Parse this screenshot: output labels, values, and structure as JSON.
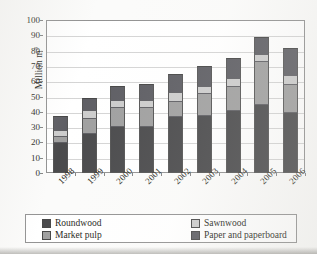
{
  "chart_data": {
    "type": "bar",
    "subtype": "stacked-bar",
    "title": "",
    "xlabel": "",
    "ylabel": "Million m",
    "ylabel_superscript": "3",
    "ylim": [
      0,
      100
    ],
    "ytick_step": 10,
    "yticks": [
      "100",
      "90",
      "80",
      "70",
      "60",
      "50",
      "40",
      "30",
      "20",
      "10",
      "0"
    ],
    "grid": true,
    "legend_position": "bottom",
    "categories": [
      "1998",
      "1999",
      "2000",
      "2001",
      "2002",
      "2003",
      "2004",
      "2005",
      "2006"
    ],
    "series": [
      {
        "name": "Roundwood",
        "color": "#3f3f41",
        "values": [
          20,
          26,
          31,
          31,
          37,
          38,
          41,
          45,
          40
        ]
      },
      {
        "name": "Market pulp",
        "color": "#9a9a9a",
        "values": [
          4,
          10,
          12,
          12,
          10,
          14,
          16,
          28,
          18
        ]
      },
      {
        "name": "Sawnwood",
        "color": "#c9c9c9",
        "values": [
          4,
          5,
          5,
          5,
          6,
          5,
          5,
          5,
          6
        ]
      },
      {
        "name": "Paper and paperboard",
        "color": "#54545a",
        "values": [
          9,
          8,
          9,
          10,
          12,
          13,
          13,
          11,
          18
        ]
      }
    ],
    "totals": [
      37,
      49,
      57,
      58,
      65,
      70,
      75,
      89,
      82
    ]
  },
  "legend": {
    "entries": [
      {
        "label": "Roundwood",
        "color": "#3f3f41"
      },
      {
        "label": "Sawnwood",
        "color": "#c9c9c9"
      },
      {
        "label": "Market pulp",
        "color": "#9a9a9a"
      },
      {
        "label": "Paper and paperboard",
        "color": "#54545a"
      }
    ]
  }
}
